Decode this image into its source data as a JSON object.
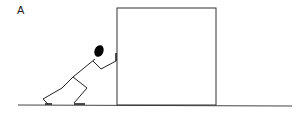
{
  "figure": {
    "panel_label": "A",
    "colors": {
      "stroke": "#333333",
      "head": "#000000",
      "background": "#ffffff"
    }
  }
}
